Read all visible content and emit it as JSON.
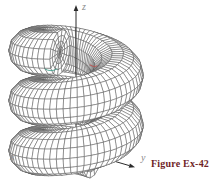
{
  "figure": {
    "caption": "Figure Ex-42",
    "caption_color": "#701f28",
    "axis_labels": {
      "x": "x",
      "y": "y",
      "z": "z"
    },
    "axis_label_color": "#8a8a8a"
  },
  "chart_data": {
    "type": "surface",
    "subtype": "3d-wireframe-parametric",
    "title": "",
    "parametric_equations": {
      "x": "(R + r cos v) cos u",
      "y": "(R + r cos v) sin u",
      "z": "(pitch/2π) u + r sin v"
    },
    "axes": {
      "x": "x",
      "y": "y",
      "z": "z",
      "grid": false,
      "legend": "none"
    },
    "geometry": {
      "origin": [
        76,
        150
      ],
      "shear_x": 0.82,
      "shear_y": 0.24,
      "helix_radius": 36,
      "tube_radius": 22,
      "pitch": 50,
      "z_offset": 5.75,
      "u_start_deg": -158,
      "u_end_deg": 742,
      "u_steps": 150,
      "v_steps": 14,
      "cap_rings": 4,
      "x_axis_len": 66,
      "y_axis_len": 72,
      "z_axis_len": 145
    },
    "style": {
      "mesh_stroke": "#565656",
      "mesh_width": 0.5,
      "surface_fill": "#ffffff",
      "axis_stroke": "#2b2b2b",
      "axis_width": 1,
      "background": "#ffffff",
      "edge_highlights": [
        {
          "name": "teal-cut-edge",
          "color": "#3f9e8a",
          "d": "M45,69 Q51,72.5 57,69"
        },
        {
          "name": "red-cut-edge",
          "color": "#c0504d",
          "d": "M90,65 q4,3 7,1"
        }
      ]
    }
  }
}
